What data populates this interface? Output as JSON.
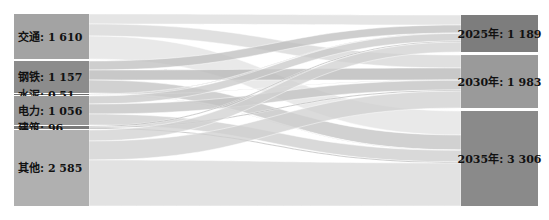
{
  "chart_data": {
    "type": "sankey",
    "title": "",
    "caption": "",
    "sources": [
      {
        "id": "transport",
        "label": "交通: 1 610",
        "name": "交通",
        "value": 1610,
        "y0": 14,
        "y1": 59,
        "color": "#a3a3a3"
      },
      {
        "id": "steel",
        "label": "钢铁: 1 157",
        "name": "钢铁",
        "value": 1157,
        "y0": 61,
        "y1": 93,
        "color": "#8c8c8c"
      },
      {
        "id": "cement",
        "label": "水泥: 0.51",
        "name": "水泥",
        "value": 0.51,
        "y0": 94,
        "y1": 95,
        "color": "#6f6f6f"
      },
      {
        "id": "power",
        "label": "电力: 1 056",
        "name": "电力",
        "value": 1056,
        "y0": 96,
        "y1": 125,
        "color": "#999999"
      },
      {
        "id": "building",
        "label": "建筑: 96",
        "name": "建筑",
        "value": 96,
        "y0": 126,
        "y1": 129,
        "color": "#7a7a7a"
      },
      {
        "id": "other",
        "label": "其他: 2 585",
        "name": "其他",
        "value": 2585,
        "y0": 130,
        "y1": 206,
        "color": "#b0b0b0"
      }
    ],
    "targets": [
      {
        "id": "y2025",
        "label": "2025年: 1 189",
        "name": "2025年",
        "value": 1189,
        "y0": 15,
        "y1": 52,
        "color": "#7d7d7d"
      },
      {
        "id": "y2030",
        "label": "2030年: 1 983",
        "name": "2030年",
        "value": 1983,
        "y0": 55,
        "y1": 108,
        "color": "#9a9a9a"
      },
      {
        "id": "y2035",
        "label": "2035年: 3 306",
        "name": "2035年",
        "value": 3306,
        "y0": 111,
        "y1": 206,
        "color": "#8a8a8a"
      }
    ],
    "links": [
      {
        "source": "transport",
        "target": "y2025",
        "sy0": 14,
        "sy1": 24,
        "ty0": 15,
        "ty1": 25,
        "color": "#dcdcdc"
      },
      {
        "source": "transport",
        "target": "y2030",
        "sy0": 24,
        "sy1": 36,
        "ty0": 55,
        "ty1": 68,
        "color": "#d6d6d6"
      },
      {
        "source": "transport",
        "target": "y2035",
        "sy0": 36,
        "sy1": 59,
        "ty0": 111,
        "ty1": 135,
        "color": "#e2e2e2"
      },
      {
        "source": "steel",
        "target": "y2025",
        "sy0": 61,
        "sy1": 70,
        "ty0": 25,
        "ty1": 33,
        "color": "#bdbdbd"
      },
      {
        "source": "steel",
        "target": "y2030",
        "sy0": 70,
        "sy1": 80,
        "ty0": 68,
        "ty1": 80,
        "color": "#b5b5b5"
      },
      {
        "source": "steel",
        "target": "y2035",
        "sy0": 80,
        "sy1": 93,
        "ty0": 135,
        "ty1": 150,
        "color": "#c2c2c2"
      },
      {
        "source": "cement",
        "target": "y2025",
        "sy0": 94,
        "sy1": 94.4,
        "ty0": 33,
        "ty1": 33.4,
        "color": "#9a9a9a"
      },
      {
        "source": "cement",
        "target": "y2030",
        "sy0": 94.4,
        "sy1": 94.7,
        "ty0": 80,
        "ty1": 80.3,
        "color": "#9a9a9a"
      },
      {
        "source": "cement",
        "target": "y2035",
        "sy0": 94.7,
        "sy1": 95,
        "ty0": 150,
        "ty1": 150.3,
        "color": "#9a9a9a"
      },
      {
        "source": "power",
        "target": "y2025",
        "sy0": 96,
        "sy1": 104,
        "ty0": 33.4,
        "ty1": 41,
        "color": "#c8c8c8"
      },
      {
        "source": "power",
        "target": "y2030",
        "sy0": 104,
        "sy1": 114,
        "ty0": 80.3,
        "ty1": 90,
        "color": "#c0c0c0"
      },
      {
        "source": "power",
        "target": "y2035",
        "sy0": 114,
        "sy1": 125,
        "ty0": 150.3,
        "ty1": 162,
        "color": "#cccccc"
      },
      {
        "source": "building",
        "target": "y2025",
        "sy0": 126,
        "sy1": 127,
        "ty0": 41,
        "ty1": 42,
        "color": "#8f8f8f"
      },
      {
        "source": "building",
        "target": "y2030",
        "sy0": 127,
        "sy1": 128,
        "ty0": 90,
        "ty1": 91,
        "color": "#8f8f8f"
      },
      {
        "source": "building",
        "target": "y2035",
        "sy0": 128,
        "sy1": 129,
        "ty0": 162,
        "ty1": 163,
        "color": "#8f8f8f"
      },
      {
        "source": "other",
        "target": "y2025",
        "sy0": 130,
        "sy1": 141,
        "ty0": 42,
        "ty1": 52,
        "color": "#d0d0d0"
      },
      {
        "source": "other",
        "target": "y2030",
        "sy0": 141,
        "sy1": 160,
        "ty0": 91,
        "ty1": 108,
        "color": "#cfcfcf"
      },
      {
        "source": "other",
        "target": "y2035",
        "sy0": 160,
        "sy1": 206,
        "ty0": 163,
        "ty1": 206,
        "color": "#d8d8d8"
      }
    ],
    "layout": {
      "left_x0": 14,
      "left_x1": 89,
      "right_x0": 461,
      "right_x1": 538,
      "grid": false,
      "legend": "none"
    }
  }
}
